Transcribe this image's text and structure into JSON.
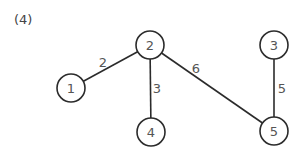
{
  "problem": {
    "label": "(4)"
  },
  "graph": {
    "directed": false,
    "colors": {
      "line": "#2b2b2b",
      "text": "#555555",
      "node_fill": "#ffffff"
    },
    "node_radius": 14,
    "nodes": [
      {
        "id": "1",
        "label": "1",
        "x": 71,
        "y": 88
      },
      {
        "id": "2",
        "label": "2",
        "x": 150,
        "y": 45
      },
      {
        "id": "3",
        "label": "3",
        "x": 274,
        "y": 45
      },
      {
        "id": "4",
        "label": "4",
        "x": 151,
        "y": 132
      },
      {
        "id": "5",
        "label": "5",
        "x": 274,
        "y": 131
      }
    ],
    "edges": [
      {
        "from": "1",
        "to": "2",
        "weight": "2",
        "label_x": 103,
        "label_y": 62
      },
      {
        "from": "2",
        "to": "4",
        "weight": "3",
        "label_x": 157,
        "label_y": 88
      },
      {
        "from": "2",
        "to": "5",
        "weight": "6",
        "label_x": 196,
        "label_y": 68
      },
      {
        "from": "3",
        "to": "5",
        "weight": "5",
        "label_x": 282,
        "label_y": 88
      }
    ]
  }
}
